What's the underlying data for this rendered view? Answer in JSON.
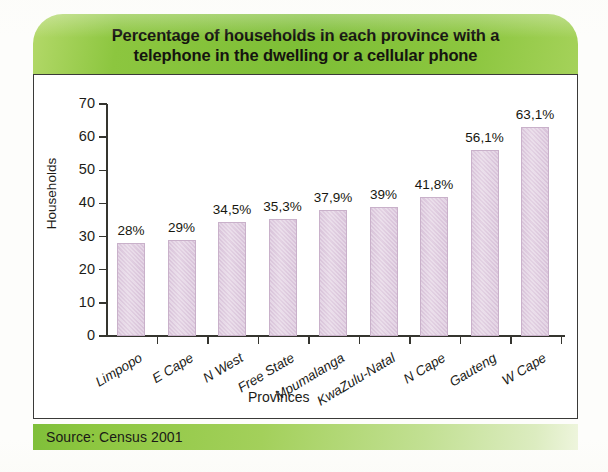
{
  "title": "Percentage of households in each province with a\ntelephone in the dwelling or a cellular phone",
  "source": "Source: Census 2001",
  "colors": {
    "banner_green": "#8cc63f",
    "bar_fill": "#ddc8dd",
    "bar_border": "#c9b1ca",
    "frame": "#3a3a38",
    "text": "#1c1c18"
  },
  "chart_data": {
    "type": "bar",
    "title": "Percentage of households in each province with a telephone in the dwelling or a cellular phone",
    "xlabel": "Provinces",
    "ylabel": "Households",
    "ylim": [
      0,
      70
    ],
    "yticks": [
      "0",
      "10",
      "20",
      "30",
      "40",
      "50",
      "60",
      "70"
    ],
    "ytick_values": [
      0,
      10,
      20,
      30,
      40,
      50,
      60,
      70
    ],
    "grid": false,
    "legend": "none",
    "categories": [
      "Limpopo",
      "E Cape",
      "N West",
      "Free State",
      "Mpumalanga",
      "KwaZulu-Natal",
      "N Cape",
      "Gauteng",
      "W Cape"
    ],
    "values": [
      28,
      29,
      34.5,
      35.3,
      37.9,
      39,
      41.8,
      56.1,
      63.1
    ],
    "data_labels": [
      "28%",
      "29%",
      "34,5%",
      "35,3%",
      "37,9%",
      "39%",
      "41,8%",
      "56,1%",
      "63,1%"
    ],
    "source": "Source: Census 2001"
  }
}
